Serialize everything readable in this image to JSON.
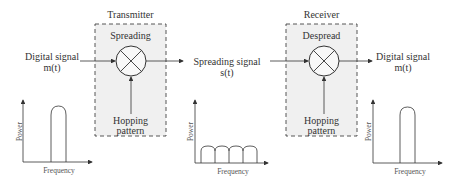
{
  "diagram": {
    "transmitter": {
      "title": "Transmitter",
      "block_label": "Spreading",
      "hopping_label_1": "Hopping",
      "hopping_label_2": "pattern"
    },
    "receiver": {
      "title": "Receiver",
      "block_label": "Despread",
      "hopping_label_1": "Hopping",
      "hopping_label_2": "pattern"
    },
    "input_signal": {
      "line1": "Digital signal",
      "line2": "m(t)"
    },
    "spread_signal": {
      "line1": "Spreading signal",
      "line2": "s(t)"
    },
    "output_signal": {
      "line1": "Digital signal",
      "line2": "m(t)"
    },
    "plots": [
      {
        "ylabel": "Power",
        "xlabel": "Frequency",
        "shape": "single narrow peak"
      },
      {
        "ylabel": "Power",
        "xlabel": "Frequency",
        "shape": "four low wide humps"
      },
      {
        "ylabel": "Power",
        "xlabel": "Frequency",
        "shape": "single narrow peak"
      }
    ]
  }
}
